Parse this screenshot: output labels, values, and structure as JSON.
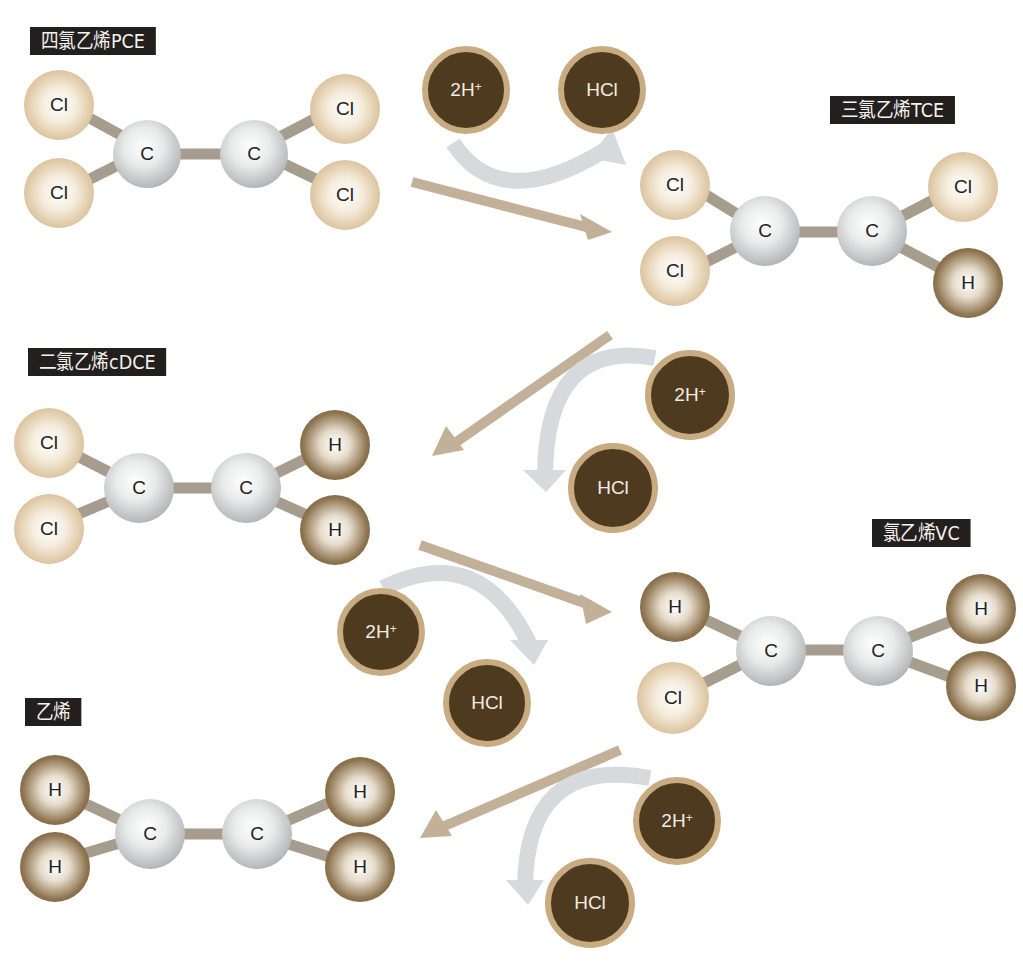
{
  "molecules": [
    {
      "label": "四氯乙烯PCE",
      "atoms": {
        "c1": "C",
        "c2": "C",
        "tl": "Cl",
        "bl": "Cl",
        "tr": "Cl",
        "br": "Cl"
      }
    },
    {
      "label": "三氯乙烯TCE",
      "atoms": {
        "c1": "C",
        "c2": "C",
        "tl": "Cl",
        "bl": "Cl",
        "tr": "Cl",
        "br": "H"
      }
    },
    {
      "label": "二氯乙烯cDCE",
      "atoms": {
        "c1": "C",
        "c2": "C",
        "tl": "Cl",
        "bl": "Cl",
        "tr": "H",
        "br": "H"
      }
    },
    {
      "label": "氯乙烯VC",
      "atoms": {
        "c1": "C",
        "c2": "C",
        "tl": "H",
        "bl": "Cl",
        "tr": "H",
        "br": "H"
      }
    },
    {
      "label": "乙烯",
      "atoms": {
        "c1": "C",
        "c2": "C",
        "tl": "H",
        "bl": "H",
        "tr": "H",
        "br": "H"
      }
    }
  ],
  "steps": [
    {
      "reactant": "2H",
      "reactant_charge": "+",
      "product": "HCl"
    },
    {
      "reactant": "2H",
      "reactant_charge": "+",
      "product": "HCl"
    },
    {
      "reactant": "2H",
      "reactant_charge": "+",
      "product": "HCl"
    },
    {
      "reactant": "2H",
      "reactant_charge": "+",
      "product": "HCl"
    }
  ],
  "colors": {
    "label_bg": "#231f1e",
    "ion_fill": "#4e3a1f",
    "ion_ring": "#c8ab80",
    "main_arrow": "#c2b198",
    "side_arrow": "#d6dadc"
  }
}
